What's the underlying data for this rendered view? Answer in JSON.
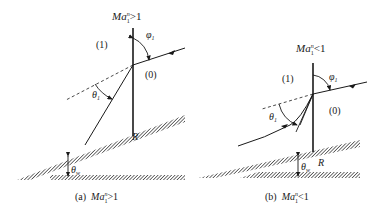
{
  "figure": {
    "panels": [
      {
        "id": "a",
        "condition_label": "Ma",
        "condition_sup": "n",
        "condition_sub": "1",
        "condition_rel": ">1",
        "caption_prefix": "(a)",
        "region_upstream": "(1)",
        "region_downstream": "(0)",
        "angle_phi": "φ",
        "angle_phi_sub": "1",
        "angle_theta": "θ",
        "angle_theta_sub": "1",
        "angle_wedge": "θ",
        "angle_wedge_sub": "w",
        "point_label": "R"
      },
      {
        "id": "b",
        "condition_label": "Ma",
        "condition_sup": "n",
        "condition_sub": "1",
        "condition_rel": "<1",
        "caption_prefix": "(b)",
        "region_upstream": "(1)",
        "region_downstream": "(0)",
        "angle_phi": "φ",
        "angle_phi_sub": "1",
        "angle_theta": "θ",
        "angle_theta_sub": "1",
        "angle_wedge": "θ",
        "angle_wedge_sub": "w",
        "point_label": "R"
      }
    ],
    "colors": {
      "line": "#1a1a1a",
      "hatch": "#333333",
      "background": "#ffffff"
    }
  }
}
